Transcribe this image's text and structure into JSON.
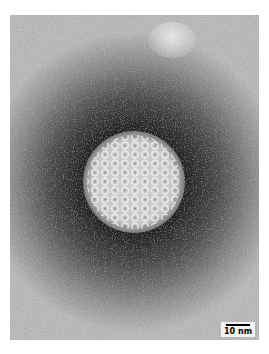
{
  "image": {
    "subject": "electron micrograph of an icosahedral virus particle (negative stain)",
    "scale_bar": {
      "label": "10 nm"
    },
    "colors": {
      "background": "#ffffff",
      "field_light": "#b5b5b5",
      "field_mid": "#8a8a8a",
      "halo_dark": "#2a2a2a",
      "particle": "#d8d8d8"
    }
  }
}
